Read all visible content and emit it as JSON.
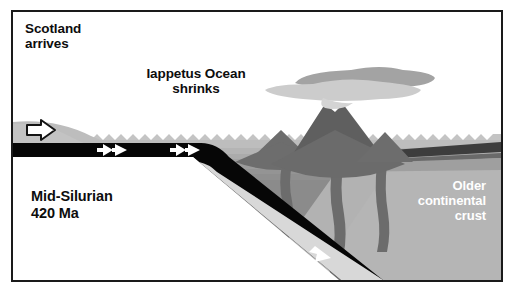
{
  "figure": {
    "width": 516,
    "height": 296,
    "background": "#ffffff",
    "frame_color": "#1a1a1a"
  },
  "labels": {
    "scotland": "Scotland\narrives",
    "iapetus": "Iappetus Ocean\nshrinks",
    "age": "Mid-Silurian\n420 Ma",
    "older_crust": "Older\ncontinental\ncrust"
  },
  "colors": {
    "sky": "#ffffff",
    "ocean_surface": "#c9c9c9",
    "ocean_upper": "#bcbcbc",
    "ocean_mid": "#a8a8a8",
    "ocean_deep": "#9a9a9a",
    "continental_crust": "#b3b3b3",
    "scotland_block": "#bdbdbd",
    "subducting_slab": "#050505",
    "volcano": "#6e6e6e",
    "magma": "#6e6e6e",
    "ash_plume_dark": "#a5a5a5",
    "ash_plume_light": "#cdcdcd",
    "dark_band": "#3f3f3f",
    "arrow_fill": "#ffffff",
    "arrow_outline": "#141414",
    "text_dark": "#0d0d0d",
    "text_light": "#ffffff"
  },
  "features": [
    {
      "name": "scotland-landmass",
      "description": "Grey continental block entering from the left edge above sea level"
    },
    {
      "name": "iapetus-ocean",
      "description": "Banded grey ocean water with zigzag wave surface across the middle"
    },
    {
      "name": "subducting-slab",
      "description": "Black oceanic plate moving right then diving steeply down to the lower right"
    },
    {
      "name": "volcanic-arc",
      "description": "Three grey volcanoes with magma conduits rising from the subducting slab"
    },
    {
      "name": "ash-plume",
      "description": "Two-tone grey eruption cloud above the largest volcano"
    },
    {
      "name": "older-continental-crust",
      "description": "Large grey crustal block occupying the right side of the section"
    }
  ],
  "motion_arrows": [
    {
      "name": "scotland-motion-arrow",
      "style": "outlined",
      "direction": "right",
      "x": 18,
      "y": 115
    },
    {
      "name": "slab-arrow-1",
      "style": "solid-double-chevron",
      "direction": "right",
      "x": 95,
      "y": 143
    },
    {
      "name": "slab-arrow-2",
      "style": "solid-double-chevron",
      "direction": "right",
      "x": 168,
      "y": 143
    },
    {
      "name": "slab-arrow-3",
      "style": "solid-chevron",
      "direction": "down-right",
      "x": 228,
      "y": 201
    },
    {
      "name": "slab-arrow-4",
      "style": "solid-chevron",
      "direction": "down-right",
      "x": 308,
      "y": 243
    }
  ],
  "sediment_bands": [
    {
      "y": 136,
      "color": "#bcbcbc"
    },
    {
      "y": 142,
      "color": "#b0b0b0"
    },
    {
      "y": 147,
      "color": "#a4a4a4"
    },
    {
      "y": 152,
      "color": "#9c9c9c"
    },
    {
      "y": 157,
      "color": "#949494"
    },
    {
      "y": 162,
      "color": "#8e8e8e"
    }
  ]
}
